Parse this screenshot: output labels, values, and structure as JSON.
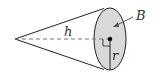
{
  "diagram": {
    "type": "cone",
    "labels": {
      "height": "h",
      "base_area": "B",
      "radius": "r"
    },
    "colors": {
      "base_fill": "#d9d9d9",
      "stroke": "#222222",
      "dash": "#777777"
    }
  }
}
